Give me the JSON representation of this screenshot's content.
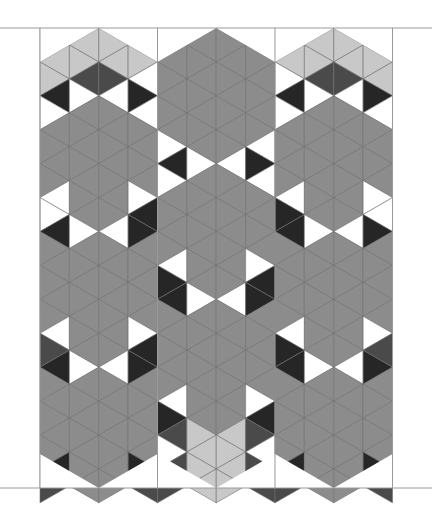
{
  "figure": {
    "title": ""
  },
  "layout": {
    "width": 432,
    "height": 507,
    "top_line_y": 28,
    "bottom_line_y": 488,
    "column_lines_x": [
      40,
      157.5,
      275,
      392.5
    ],
    "columns": 3
  },
  "colors": {
    "background": "#ffffff",
    "frame_line": "#9a9a9a",
    "star": "#8c8c8c",
    "light": "#c8c8c8",
    "dark_print": "#4a4a4a",
    "darkest": "#262626",
    "white": "#ffffff",
    "seam": "#6e6e6e"
  },
  "stars": {
    "left_column_centers_y": [
      160,
      291,
      422
    ],
    "middle_column_centers_y": [
      95,
      226,
      357
    ],
    "right_column_centers_y": [
      160,
      291,
      422
    ]
  }
}
